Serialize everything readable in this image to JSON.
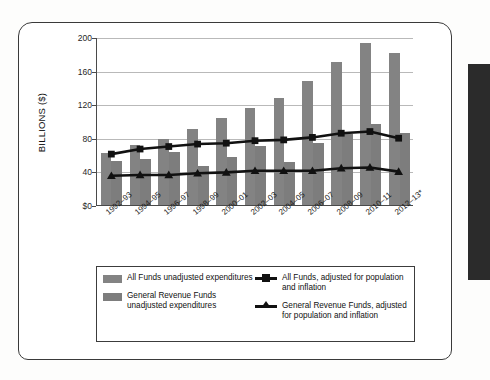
{
  "chart_data": {
    "type": "bar",
    "title": "",
    "xlabel": "",
    "ylabel": "BILLIONS ($)",
    "ylim": [
      0,
      200
    ],
    "yticks": [
      "$0",
      "40",
      "80",
      "120",
      "160",
      "200"
    ],
    "ytick_values": [
      0,
      40,
      80,
      120,
      160,
      200
    ],
    "grid": true,
    "legend_position": "below-plot",
    "categories": [
      "1992–93",
      "1994–95",
      "1996–97",
      "1998–99",
      "2000–01",
      "2002–03",
      "2004–05",
      "2006–07",
      "2008–09",
      "2010–11",
      "2012–13*"
    ],
    "series": [
      {
        "name": "All Funds unadjusted expenditures",
        "kind": "bar",
        "color": "#838383",
        "values": [
          62,
          72,
          79,
          90,
          103,
          115,
          127,
          148,
          170,
          193,
          181
        ]
      },
      {
        "name": "General Revenue Funds unadjusted expenditures",
        "kind": "bar",
        "color": "#7d7d7d",
        "values": [
          52,
          55,
          63,
          46,
          57,
          70,
          51,
          74,
          84,
          97,
          86
        ]
      },
      {
        "name": "All Funds, adjusted for population and inflation",
        "kind": "line",
        "marker": "square",
        "color": "#111111",
        "values": [
          61,
          67,
          70,
          73,
          74,
          77,
          78,
          81,
          86,
          88,
          80
        ]
      },
      {
        "name": "General Revenue Funds, adjusted for population and inflation",
        "kind": "line",
        "marker": "triangle",
        "color": "#111111",
        "values": [
          35,
          36,
          36,
          38,
          39,
          41,
          41,
          41,
          44,
          45,
          40
        ]
      }
    ]
  },
  "legend": {
    "entries": [
      {
        "id": "all-funds-unadjusted",
        "marker": "swatch",
        "label": "All Funds unadjusted expenditures"
      },
      {
        "id": "grf-unadjusted",
        "marker": "swatch",
        "label": "General Revenue Funds unadjusted expenditures"
      },
      {
        "id": "all-funds-adjusted",
        "marker": "line-square",
        "label": "All Funds, adjusted for population and inflation"
      },
      {
        "id": "grf-adjusted",
        "marker": "line-triangle",
        "label": "General Revenue Funds, adjusted for population and inflation"
      }
    ]
  },
  "colors": {
    "bar_all_funds": "#838383",
    "bar_general_revenue": "#7d7d7d",
    "line": "#111111",
    "grid": "#b9b9b9",
    "axis": "#4a4a4a"
  }
}
